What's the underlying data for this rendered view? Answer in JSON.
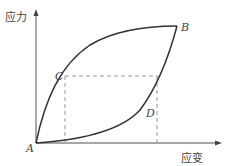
{
  "diagram": {
    "type": "stress-strain hysteresis loop",
    "y_axis_label": "应力",
    "x_axis_label": "应变",
    "points": {
      "A": "A",
      "B": "B",
      "C": "C",
      "D": "D"
    },
    "colors": {
      "curve": "#333333",
      "axis": "#555555",
      "dashed": "#888888",
      "text": "#444444"
    }
  }
}
